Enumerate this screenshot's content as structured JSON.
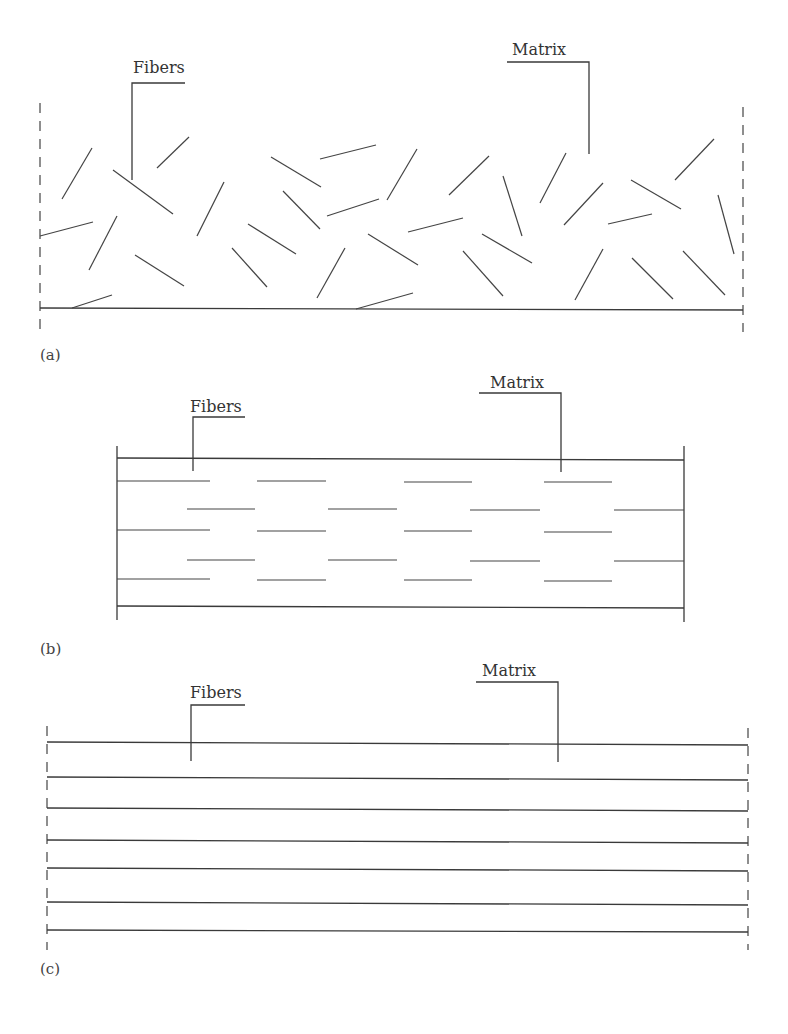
{
  "figure": {
    "panels": [
      {
        "id": "a",
        "caption": "(a)",
        "description": "Randomly oriented short fibers in matrix",
        "labels": {
          "fibers": "Fibers",
          "matrix": "Matrix"
        }
      },
      {
        "id": "b",
        "caption": "(b)",
        "description": "Aligned discontinuous (short) fibers in matrix",
        "labels": {
          "fibers": "Fibers",
          "matrix": "Matrix"
        }
      },
      {
        "id": "c",
        "caption": "(c)",
        "description": "Continuous aligned fibers in matrix",
        "labels": {
          "fibers": "Fibers",
          "matrix": "Matrix"
        }
      }
    ],
    "colors": {
      "line": "#3a3a3a",
      "text": "#333333",
      "background": "#ffffff"
    }
  }
}
